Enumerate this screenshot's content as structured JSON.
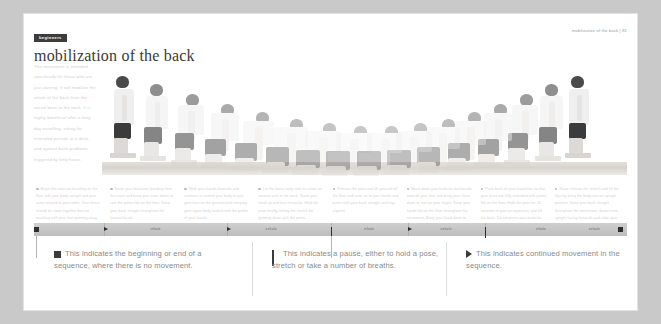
{
  "header": {
    "badge": "beginners",
    "title": "mobilization of the back",
    "folio": "mobilization of the back | 81"
  },
  "intro": {
    "lines": [
      "This movement is intended",
      "specifically for those who are",
      "just starting. It will mobilize the",
      "whole of the back from the",
      "sacral bone to the neck. It is",
      "highly beneficial after a long",
      "day travelling, sitting for",
      "extended periods at a desk,",
      "and against back problems",
      "triggered by long hours."
    ]
  },
  "captions": [
    "Begin the exercise kneeling on the floor with your body upright and your arms relaxed at your sides. Your knees should be close together but not touching with your feet pointing away from your body.",
    "Raise your forearms, bending from the waist and bring your arms down to rest the palms flat on the floor. Keep your back straight throughout the forward bend.",
    "Walk your hands forwards and continue to extend your body to part your face on the ground while keeping your upper body loaded with the palms of your hands.",
    "Let the lower body sink to create an inverse arch in the back. Raise your head up and face forwards. Hold the pose briefly, letting the stretch be growing down with the joints.",
    "Release the pose and lift yourself off the floor and raise on to your hands and wrists with your back straight and legs aligned.",
    "Move down your buttocks backwards towards your feet and bring your chest down to rest on your thighs. Keep your hands flat on the floor throughout the movement. Bring your head down to rest the floor.",
    "Push back on your haunches so that your arms are fully extended with palms flat on the floor. Hold the pose for 20 seconds to gain as squeezes, and lift the base. Do not press your buttocks back on to your feet as this can compress the lower joints.",
    "Raise release the stretch and lift the hips by bring the body into an upright position. Keep your back straight throughout the movement, drawn from upright facing forwards and relax your arms at your sides."
  ],
  "timeline": {
    "markers": [
      {
        "type": "square",
        "x": 0.0
      },
      {
        "type": "triangle",
        "x": 0.118
      },
      {
        "type": "triangle",
        "x": 0.326
      },
      {
        "type": "pause",
        "x": 0.5
      },
      {
        "type": "triangle",
        "x": 0.63
      },
      {
        "type": "pause",
        "x": 0.76
      },
      {
        "type": "square",
        "x": 0.985
      }
    ],
    "labels": [
      {
        "text": "inhale",
        "x": 0.205
      },
      {
        "text": "exhale",
        "x": 0.4
      },
      {
        "text": "inhale",
        "x": 0.565
      },
      {
        "text": "exhale",
        "x": 0.695
      },
      {
        "text": "inhale",
        "x": 0.855
      },
      {
        "text": "exhale",
        "x": 0.945
      }
    ],
    "ticks": [
      0.118,
      0.326,
      0.5,
      0.63,
      0.76
    ]
  },
  "legend": [
    {
      "symbol": "square",
      "text": "This indicates the beginning or end of a sequence, where there is no movement."
    },
    {
      "symbol": "pause",
      "text": "This indicates a pause, either to hold a pose, stretch or take a number of breaths."
    },
    {
      "symbol": "triangle",
      "text": "This indicates continued movement in the sequence."
    }
  ],
  "colors": {
    "page": "#ffffff",
    "surround": "#c9c9c9",
    "ink": "#3a3a3a",
    "muted": "#8a8a8a",
    "bar": "#c6c6c6",
    "marker": "#2e2e2e"
  }
}
